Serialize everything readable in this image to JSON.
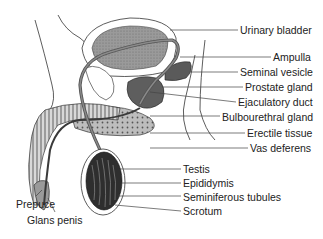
{
  "diagram": {
    "labels_right": [
      {
        "text": "Urinary bladder",
        "x": 240,
        "y": 24
      },
      {
        "text": "Ampulla",
        "x": 273,
        "y": 51
      },
      {
        "text": "Seminal vesicle",
        "x": 240,
        "y": 66
      },
      {
        "text": "Prostate gland",
        "x": 245,
        "y": 81
      },
      {
        "text": "Ejaculatory duct",
        "x": 238,
        "y": 96
      },
      {
        "text": "Bulbourethral gland",
        "x": 222,
        "y": 111
      },
      {
        "text": "Erectile tissue",
        "x": 247,
        "y": 127
      },
      {
        "text": "Vas deferens",
        "x": 250,
        "y": 142
      }
    ],
    "labels_center": [
      {
        "text": "Testis",
        "x": 183,
        "y": 163
      },
      {
        "text": "Epididymis",
        "x": 183,
        "y": 177
      },
      {
        "text": "Seminiferous tubules",
        "x": 183,
        "y": 191
      },
      {
        "text": "Scrotum",
        "x": 183,
        "y": 205
      }
    ],
    "labels_left": [
      {
        "text": "Prepuce",
        "x": 16,
        "y": 198
      },
      {
        "text": "Glans penis",
        "x": 27,
        "y": 214
      }
    ]
  }
}
